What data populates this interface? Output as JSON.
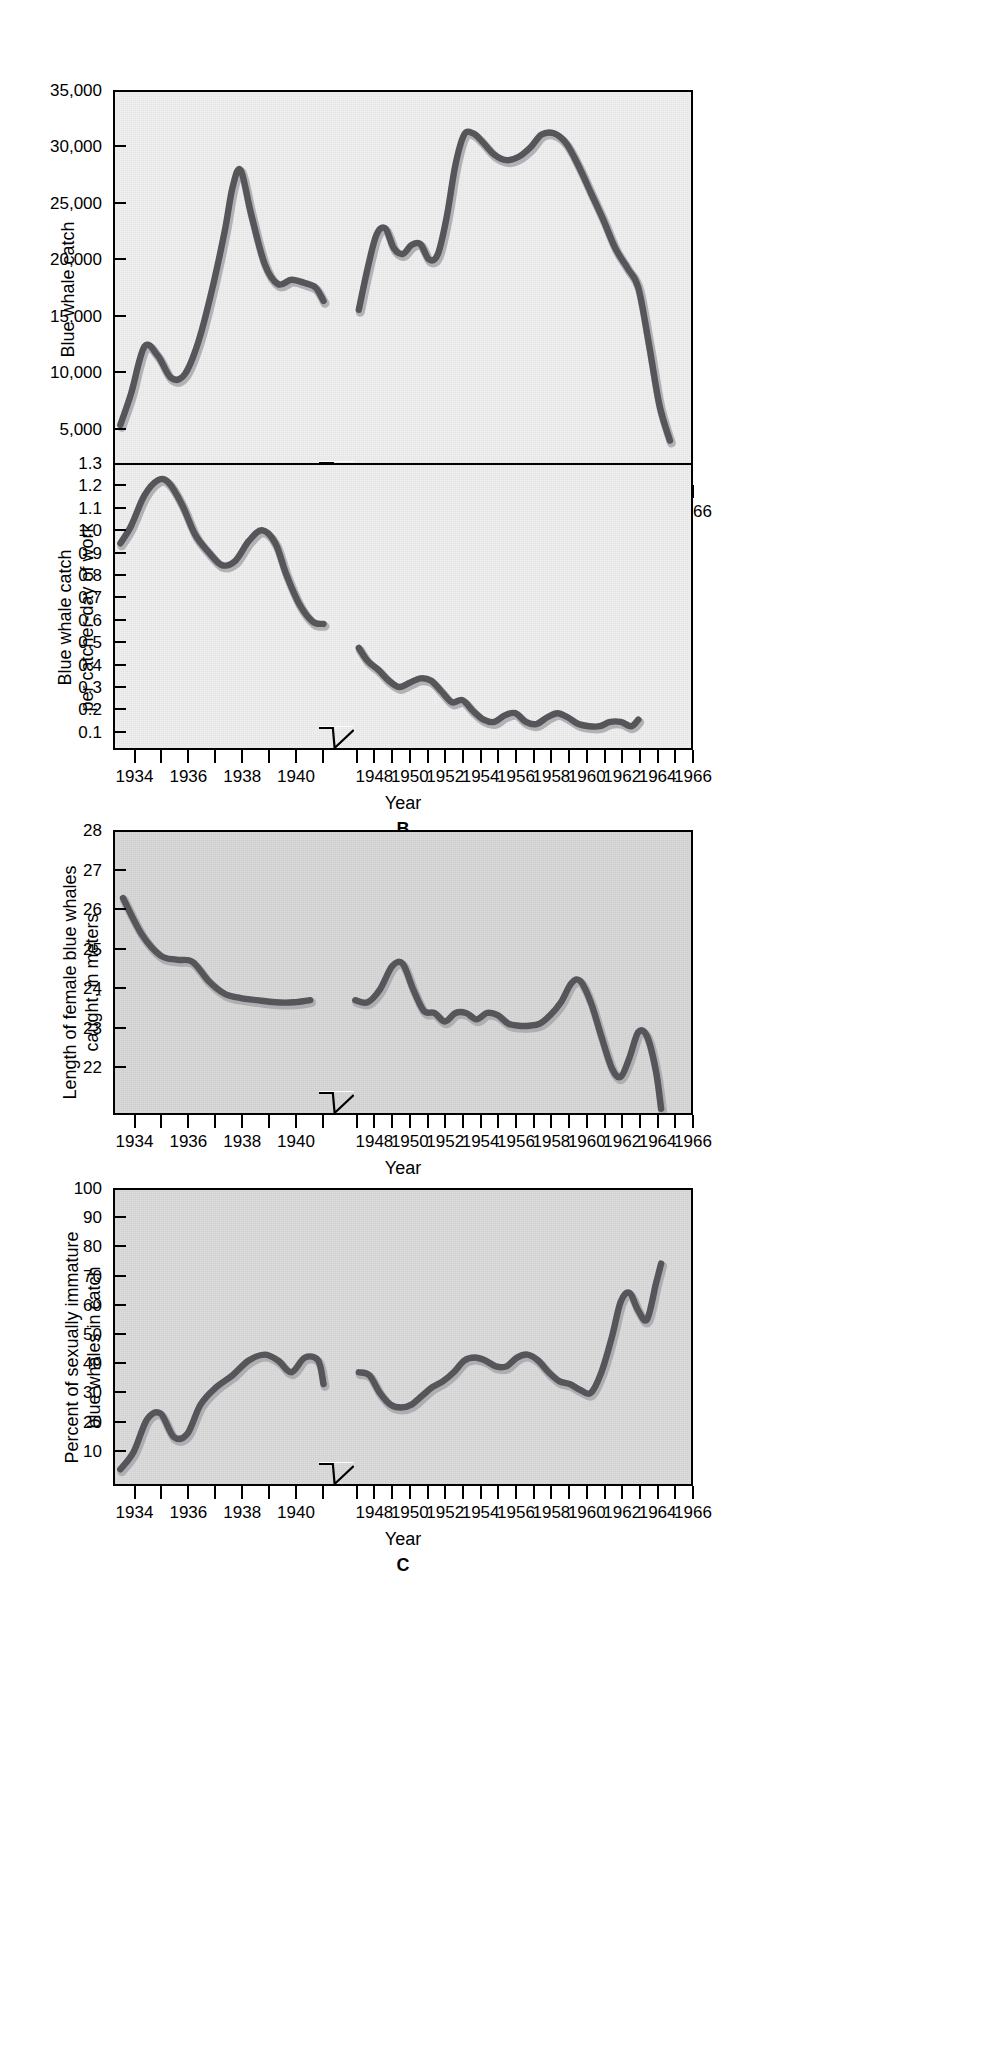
{
  "figure": {
    "shared_xaxis_label": "Year",
    "xticks": [
      "1934",
      "1936",
      "1938",
      "1940",
      "1948",
      "1950",
      "1952",
      "1954",
      "1956",
      "1958",
      "1960",
      "1962",
      "1964",
      "1966"
    ],
    "axis_break_note": "broken x-axis between 1941 and 1947",
    "colors": {
      "line": "#55555a",
      "line_shadow": "#a8a8ad",
      "plot_light": "#f0f0f0",
      "plot_mid": "#d9d9d9",
      "axis": "#000000",
      "page": "#ffffff"
    }
  },
  "panels": [
    {
      "id": "A",
      "panel_label": "",
      "ylabel": "Blue whale catch",
      "xlabel": "Year",
      "yticks": [
        "5,000",
        "10,000",
        "15,000",
        "20,000",
        "25,000",
        "30,000",
        "35,000"
      ],
      "background": "light"
    },
    {
      "id": "B",
      "panel_label": "B",
      "ylabel_line1": "Blue whale catch",
      "ylabel_line2": "per catcher-day of work",
      "xlabel": "Year",
      "yticks": [
        "0.1",
        "0.2",
        "0.3",
        "0.4",
        "0.5",
        "0.6",
        "0.7",
        "0.8",
        "0.9",
        "1.0",
        "1.1",
        "1.2",
        "1.3"
      ],
      "background": "light"
    },
    {
      "id": "C",
      "panel_label": "",
      "ylabel_line1": "Length of female blue whales",
      "ylabel_line2": "caught, in meters",
      "xlabel": "Year",
      "yticks": [
        "22",
        "23",
        "24",
        "25",
        "26",
        "27",
        "28"
      ],
      "background": "mid"
    },
    {
      "id": "D",
      "panel_label": "C",
      "ylabel_line1": "Percent of sexually immature",
      "ylabel_line2": "blue whales in catch",
      "xlabel": "Year",
      "yticks": [
        "10",
        "20",
        "30",
        "40",
        "50",
        "60",
        "70",
        "80",
        "90",
        "100"
      ],
      "background": "mid2"
    }
  ],
  "chart_data": [
    {
      "type": "line",
      "id": "A",
      "title": "Blue whale catch",
      "xlabel": "Year",
      "ylabel": "Blue whale catch",
      "xlim": [
        1933.2,
        1966.0
      ],
      "ylim": [
        0,
        35000
      ],
      "ytick_values": [
        5000,
        10000,
        15000,
        20000,
        25000,
        30000,
        35000
      ],
      "xtick_values": [
        1934,
        1936,
        1938,
        1940,
        1948,
        1950,
        1952,
        1954,
        1956,
        1958,
        1960,
        1962,
        1964,
        1966
      ],
      "axis_break": [
        1941.0,
        1947.0
      ],
      "grid": false,
      "legend": "none",
      "series": [
        {
          "name": "Blue whale catch (pre-war)",
          "x": [
            1933.4,
            1933.8,
            1934.3,
            1934.8,
            1935.3,
            1935.8,
            1936.3,
            1936.8,
            1937.3,
            1937.6,
            1937.9,
            1938.3,
            1938.8,
            1939.3,
            1939.8,
            1940.3,
            1940.7,
            1941.0
          ],
          "values": [
            5200,
            8000,
            12200,
            11400,
            9400,
            9700,
            12500,
            17000,
            22500,
            26500,
            28000,
            24000,
            19600,
            17800,
            18200,
            17900,
            17500,
            16300
          ]
        },
        {
          "name": "Blue whale catch (post-war)",
          "x": [
            1947.1,
            1947.6,
            1948.1,
            1948.6,
            1949.1,
            1949.6,
            1950.1,
            1950.6,
            1951.1,
            1951.6,
            1952.1,
            1952.6,
            1953.1,
            1953.6,
            1954.1,
            1954.8,
            1955.5,
            1956.2,
            1956.9,
            1957.5,
            1958.2,
            1958.9,
            1959.6,
            1960.3,
            1961.0,
            1961.7,
            1962.4,
            1963.0,
            1963.6,
            1964.2,
            1964.8
          ],
          "values": [
            15500,
            19200,
            22200,
            22800,
            21000,
            20500,
            21300,
            21400,
            20000,
            20500,
            23800,
            28500,
            31200,
            31300,
            30600,
            29400,
            28900,
            29200,
            30100,
            31200,
            31300,
            30400,
            28400,
            26000,
            23600,
            21000,
            19200,
            17500,
            12500,
            7000,
            3800
          ]
        }
      ]
    },
    {
      "type": "line",
      "id": "B",
      "title": "Blue whale catch per catcher-day of work",
      "xlabel": "Year",
      "ylabel": "Blue whale catch per catcher-day of work",
      "xlim": [
        1933.2,
        1966.0
      ],
      "ylim": [
        0,
        1.3
      ],
      "ytick_values": [
        0.1,
        0.2,
        0.3,
        0.4,
        0.5,
        0.6,
        0.7,
        0.8,
        0.9,
        1.0,
        1.1,
        1.2,
        1.3
      ],
      "xtick_values": [
        1934,
        1936,
        1938,
        1940,
        1948,
        1950,
        1952,
        1954,
        1956,
        1958,
        1960,
        1962,
        1964,
        1966
      ],
      "axis_break": [
        1941.0,
        1947.0
      ],
      "grid": false,
      "legend": "none",
      "series": [
        {
          "name": "Catch per catcher-day (pre-war)",
          "x": [
            1933.4,
            1933.8,
            1934.3,
            1934.8,
            1935.2,
            1935.7,
            1936.2,
            1936.7,
            1937.2,
            1937.7,
            1938.2,
            1938.7,
            1939.2,
            1939.6,
            1940.1,
            1940.6,
            1941.0
          ],
          "values": [
            0.94,
            1.02,
            1.16,
            1.23,
            1.22,
            1.12,
            0.98,
            0.9,
            0.84,
            0.86,
            0.95,
            1.0,
            0.94,
            0.8,
            0.66,
            0.58,
            0.57
          ]
        },
        {
          "name": "Catch per catcher-day (post-war)",
          "x": [
            1947.1,
            1947.6,
            1948.2,
            1948.8,
            1949.4,
            1950.0,
            1950.6,
            1951.2,
            1951.8,
            1952.4,
            1953.0,
            1953.6,
            1954.2,
            1954.8,
            1955.4,
            1956.0,
            1956.6,
            1957.2,
            1957.8,
            1958.4,
            1959.0,
            1959.6,
            1960.2,
            1960.8,
            1961.4,
            1962.0,
            1962.6,
            1963.0
          ],
          "values": [
            0.46,
            0.4,
            0.36,
            0.31,
            0.28,
            0.3,
            0.32,
            0.31,
            0.26,
            0.21,
            0.22,
            0.17,
            0.13,
            0.12,
            0.15,
            0.16,
            0.12,
            0.11,
            0.14,
            0.16,
            0.14,
            0.11,
            0.1,
            0.1,
            0.12,
            0.12,
            0.1,
            0.13
          ]
        }
      ]
    },
    {
      "type": "line",
      "id": "C",
      "title": "Length of female blue whales caught, in meters",
      "xlabel": "Year",
      "ylabel": "Length of female blue whales caught, in meters",
      "xlim": [
        1933.2,
        1966.0
      ],
      "ylim": [
        21.4,
        28.0
      ],
      "ytick_values": [
        22,
        23,
        24,
        25,
        26,
        27,
        28
      ],
      "xtick_values": [
        1934,
        1936,
        1938,
        1940,
        1948,
        1950,
        1952,
        1954,
        1956,
        1958,
        1960,
        1962,
        1964,
        1966
      ],
      "axis_break": [
        1941.0,
        1947.0
      ],
      "grid": false,
      "legend": "none",
      "series": [
        {
          "name": "Female length (pre-war)",
          "x": [
            1933.5,
            1934.2,
            1934.9,
            1935.5,
            1936.1,
            1936.7,
            1937.3,
            1937.9,
            1938.5,
            1939.2,
            1939.9,
            1940.5
          ],
          "values": [
            26.45,
            25.6,
            25.1,
            25.0,
            24.95,
            24.5,
            24.2,
            24.1,
            24.05,
            24.0,
            24.0,
            24.05
          ]
        },
        {
          "name": "Female length (post-war)",
          "x": [
            1946.9,
            1947.6,
            1948.3,
            1949.0,
            1949.6,
            1950.2,
            1950.8,
            1951.4,
            1952.0,
            1952.6,
            1953.2,
            1953.8,
            1954.4,
            1955.0,
            1955.6,
            1956.2,
            1956.8,
            1957.4,
            1958.0,
            1958.6,
            1959.2,
            1959.7,
            1960.3,
            1960.9,
            1961.5,
            1962.0,
            1962.5,
            1963.0,
            1963.5,
            1964.0,
            1964.3
          ],
          "values": [
            24.05,
            24.0,
            24.3,
            24.85,
            24.9,
            24.3,
            23.8,
            23.75,
            23.55,
            23.75,
            23.75,
            23.6,
            23.75,
            23.7,
            23.5,
            23.45,
            23.45,
            23.5,
            23.7,
            24.0,
            24.45,
            24.5,
            24.0,
            23.2,
            22.45,
            22.25,
            22.7,
            23.3,
            23.2,
            22.4,
            21.5
          ]
        }
      ]
    },
    {
      "type": "line",
      "id": "D",
      "title": "Percent of sexually immature blue whales in catch",
      "xlabel": "Year",
      "ylabel": "Percent of sexually immature blue whales in catch",
      "xlim": [
        1933.2,
        1966.0
      ],
      "ylim": [
        0,
        100
      ],
      "ytick_values": [
        10,
        20,
        30,
        40,
        50,
        60,
        70,
        80,
        90,
        100
      ],
      "xtick_values": [
        1934,
        1936,
        1938,
        1940,
        1948,
        1950,
        1952,
        1954,
        1956,
        1958,
        1960,
        1962,
        1964,
        1966
      ],
      "axis_break": [
        1941.0,
        1947.0
      ],
      "grid": false,
      "legend": "none",
      "series": [
        {
          "name": "Percent immature (pre-war)",
          "x": [
            1933.4,
            1933.9,
            1934.4,
            1934.9,
            1935.4,
            1935.9,
            1936.4,
            1937.0,
            1937.6,
            1938.2,
            1938.8,
            1939.3,
            1939.8,
            1940.3,
            1940.8,
            1941.0
          ],
          "values": [
            5,
            11,
            22,
            24,
            16,
            17,
            27,
            33,
            37,
            42,
            44,
            42,
            38,
            43,
            42,
            34
          ]
        },
        {
          "name": "Percent immature (post-war)",
          "x": [
            1947.1,
            1947.7,
            1948.3,
            1948.9,
            1949.5,
            1950.1,
            1950.7,
            1951.3,
            1951.9,
            1952.5,
            1953.1,
            1953.7,
            1954.3,
            1954.9,
            1955.5,
            1956.1,
            1956.7,
            1957.3,
            1957.9,
            1958.5,
            1959.1,
            1959.7,
            1960.3,
            1960.9,
            1961.5,
            1962.0,
            1962.5,
            1963.0,
            1963.5,
            1964.0,
            1964.3
          ],
          "values": [
            38,
            37,
            31,
            27,
            26,
            27,
            30,
            33,
            35,
            38,
            42,
            43,
            42,
            40,
            40,
            43,
            44,
            42,
            38,
            35,
            34,
            32,
            31,
            38,
            50,
            62,
            65,
            59,
            56,
            68,
            75
          ]
        }
      ]
    }
  ]
}
